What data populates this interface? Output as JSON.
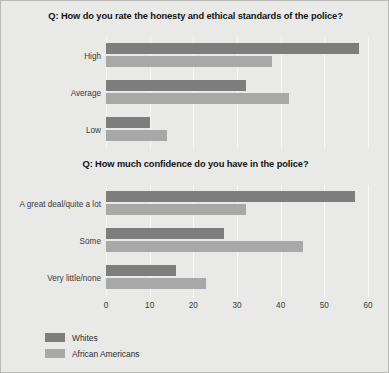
{
  "figure": {
    "background_color": "#e9e9e7",
    "border_color": "#b9b9b7"
  },
  "legend": {
    "position": "bottom-left",
    "entries": [
      {
        "label": "Whites",
        "color": "#7d7d7d",
        "swatch_name": "legend-swatch-whites"
      },
      {
        "label": "African Americans",
        "color": "#a8a8a8",
        "swatch_name": "legend-swatch-african-americans"
      }
    ]
  },
  "axis": {
    "ticks": [
      "0",
      "10",
      "20",
      "30",
      "40",
      "50",
      "60"
    ],
    "min": 0,
    "max": 60,
    "step": 10
  },
  "chart_data": [
    {
      "type": "bar",
      "orientation": "horizontal",
      "title": "Q: How do you rate the honesty and ethical standards of the police?",
      "categories": [
        "High",
        "Average",
        "Low"
      ],
      "series": [
        {
          "name": "Whites",
          "color": "#7d7d7d",
          "values": [
            58,
            32,
            10
          ]
        },
        {
          "name": "African Americans",
          "color": "#a8a8a8",
          "values": [
            38,
            42,
            14
          ]
        }
      ],
      "xlabel": "",
      "ylabel": "",
      "xlim": [
        0,
        60
      ],
      "grid": true,
      "legend_position": "bottom-left"
    },
    {
      "type": "bar",
      "orientation": "horizontal",
      "title": "Q: How much confidence do you have in the police?",
      "categories": [
        "A great deal/quite a lot",
        "Some",
        "Very little/none"
      ],
      "series": [
        {
          "name": "Whites",
          "color": "#7d7d7d",
          "values": [
            57,
            27,
            16
          ]
        },
        {
          "name": "African Americans",
          "color": "#a8a8a8",
          "values": [
            32,
            45,
            23
          ]
        }
      ],
      "xlabel": "",
      "ylabel": "",
      "xlim": [
        0,
        60
      ],
      "grid": true,
      "legend_position": "bottom-left"
    }
  ]
}
